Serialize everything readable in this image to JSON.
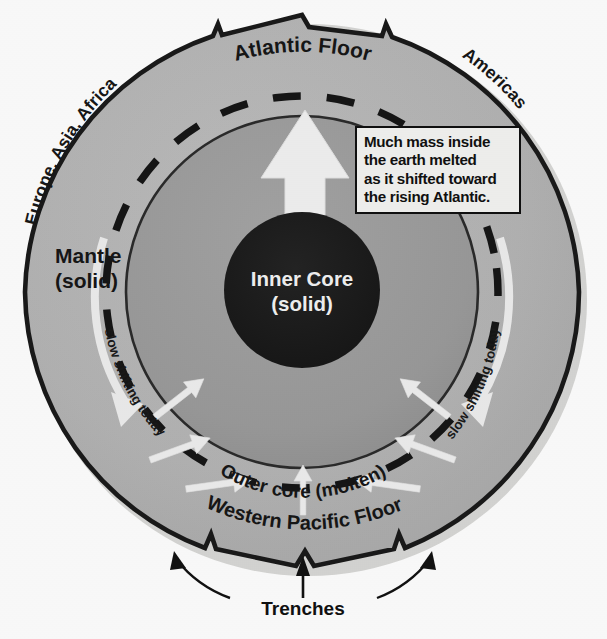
{
  "figure": {
    "background_color": "#fdfdfd"
  },
  "colors": {
    "mantle_fill": "#b4b4b4",
    "outer_core_fill": "#9b9b9b",
    "inner_core_fill": "#1c1c1c",
    "outline": "#1a1a1a",
    "arrow_white": "#f0f0f0",
    "callout_bg": "#f2f2f0",
    "callout_border": "#111111",
    "text_dark": "#151515",
    "text_light": "#f2f2f2"
  },
  "geometry": {
    "center_x": 302,
    "center_y": 292,
    "mantle_radius": 277,
    "dashed_radius": 196,
    "outer_core_radius": 176,
    "inner_core_radius": 78,
    "inner_core_center_y": 290
  },
  "labels": {
    "atlantic_floor": "Atlantic Floor",
    "western_pacific_floor": "Western Pacific Floor",
    "europe_asia_africa": "Europe, Asia, Africa",
    "americas": "Americas",
    "mantle_line1": "Mantle",
    "mantle_line2": "(solid)",
    "inner_core_line1": "Inner Core",
    "inner_core_line2": "(solid)",
    "outer_core": "Outer core (molten)",
    "slow_shifting_left": "slow shifting today",
    "slow_shifting_right": "slow shifting today",
    "trenches": "Trenches"
  },
  "callout": {
    "lines": [
      "Much mass inside",
      "the earth melted",
      "as it shifted toward",
      "the rising Atlantic."
    ],
    "line1": "Much mass inside",
    "line2": "the earth melted",
    "line3": "as it shifted toward",
    "line4": "the rising Atlantic."
  },
  "arrows": {
    "main_upward": "large-white-upward-arrow",
    "converging_count": 7,
    "slow_shift_left": "white-curved-arrow-down-left",
    "slow_shift_right": "white-curved-arrow-down-right",
    "trench_pointers": 3
  },
  "layers": [
    {
      "name": "Mantle",
      "state": "solid",
      "fill": "#b4b4b4"
    },
    {
      "name": "Outer core",
      "state": "molten",
      "fill": "#9b9b9b"
    },
    {
      "name": "Inner Core",
      "state": "solid",
      "fill": "#1c1c1c"
    }
  ]
}
